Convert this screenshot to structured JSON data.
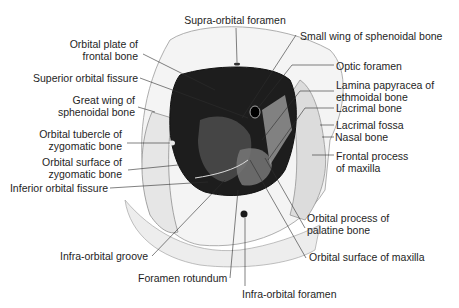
{
  "figure": {
    "labels_left": [
      {
        "id": "orbital-plate-frontal",
        "lines": [
          "Orbital plate of",
          "frontal bone"
        ]
      },
      {
        "id": "superior-orbital-fissure",
        "lines": [
          "Superior orbital fissure"
        ]
      },
      {
        "id": "great-wing-sphenoid",
        "lines": [
          "Great wing of",
          "sphenoidal bone"
        ]
      },
      {
        "id": "orbital-tubercle-zygomatic",
        "lines": [
          "Orbital tubercle of",
          "zygomatic bone"
        ]
      },
      {
        "id": "orbital-surface-zygomatic",
        "lines": [
          "Orbital surface of",
          "zygomatic bone"
        ]
      },
      {
        "id": "inferior-orbital-fissure",
        "lines": [
          "Inferior orbital fissure"
        ]
      }
    ],
    "labels_top": [
      {
        "id": "supra-orbital-foramen",
        "lines": [
          "Supra-orbital foramen"
        ]
      }
    ],
    "labels_right": [
      {
        "id": "small-wing-sphenoid",
        "lines": [
          "Small wing of sphenoidal bone"
        ]
      },
      {
        "id": "optic-foramen",
        "lines": [
          "Optic foramen"
        ]
      },
      {
        "id": "lamina-papyracea",
        "lines": [
          "Lamina papyracea of",
          "ethmoidal bone"
        ]
      },
      {
        "id": "lacrimal-bone",
        "lines": [
          "Lacrimal bone"
        ]
      },
      {
        "id": "lacrimal-fossa",
        "lines": [
          "Lacrimal fossa"
        ]
      },
      {
        "id": "nasal-bone",
        "lines": [
          "Nasal bone"
        ]
      },
      {
        "id": "frontal-process-maxilla",
        "lines": [
          "Frontal process",
          "of maxilla"
        ]
      },
      {
        "id": "orbital-process-palatine",
        "lines": [
          "Orbital process of",
          "palatine bone"
        ]
      },
      {
        "id": "orbital-surface-maxilla",
        "lines": [
          "Orbital surface of maxilla"
        ]
      }
    ],
    "labels_bottom": [
      {
        "id": "infra-orbital-groove",
        "lines": [
          "Infra-orbital groove"
        ]
      },
      {
        "id": "foramen-rotundum",
        "lines": [
          "Foramen rotundum"
        ]
      },
      {
        "id": "infra-orbital-foramen",
        "lines": [
          "Infra-orbital foramen"
        ]
      }
    ],
    "colors": {
      "background": "#ffffff",
      "text": "#1e1e1e",
      "leader": "#333333",
      "orbit_dark": "#1a1a1a",
      "bone_shade": "#8a8a8a"
    }
  }
}
